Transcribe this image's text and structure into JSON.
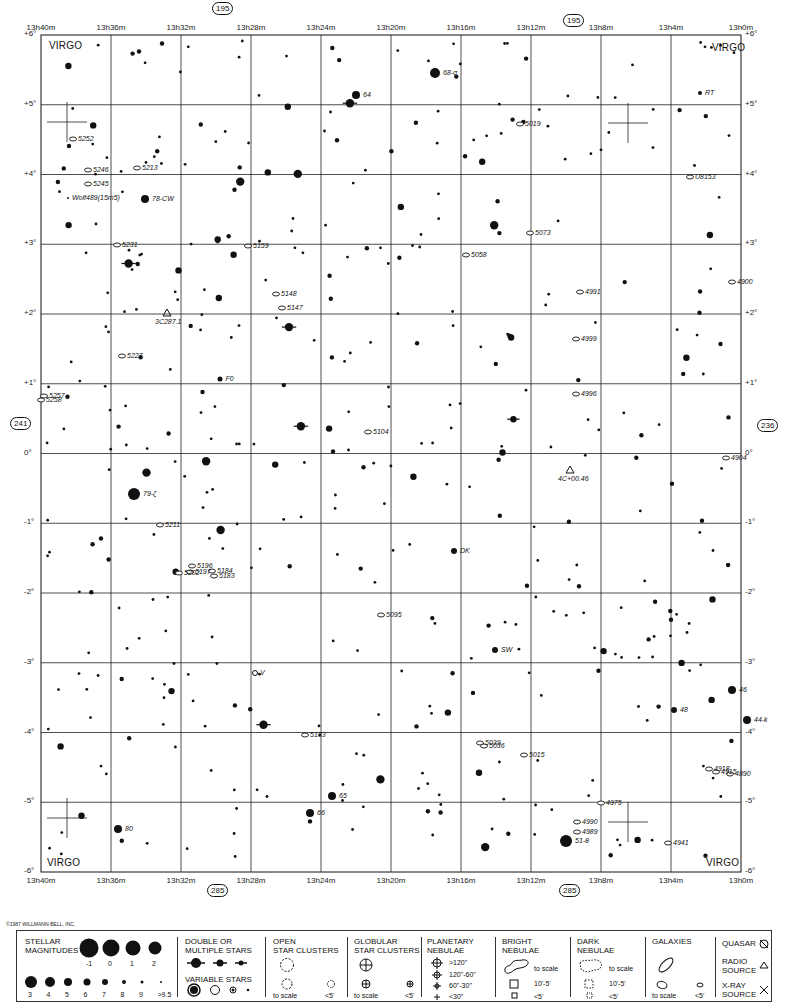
{
  "chart": {
    "constellation": "VIRGO",
    "ra_labels": [
      "13h40m",
      "13h36m",
      "13h32m",
      "13h28m",
      "13h24m",
      "13h20m",
      "13h16m",
      "13h12m",
      "13h8m",
      "13h4m",
      "13h0m"
    ],
    "dec_labels": [
      "+6°",
      "+5°",
      "+4°",
      "+3°",
      "+2°",
      "+1°",
      "0°",
      "-1°",
      "-2°",
      "-3°",
      "-4°",
      "-5°",
      "-6°"
    ],
    "page_refs": {
      "top_left": "195",
      "top_right": "195",
      "bottom_left": "285",
      "bottom_right": "285",
      "left": "241",
      "right": "236"
    },
    "corner_labels": [
      "VIRGO",
      "VIRGO",
      "VIRGO",
      "VIRGO"
    ],
    "copyright": "©1987 WILLMANN-BELL, INC."
  },
  "objects": {
    "galaxies": [
      {
        "id": "5252",
        "x": 73,
        "y": 139
      },
      {
        "id": "5246",
        "x": 88,
        "y": 170
      },
      {
        "id": "5245",
        "x": 88,
        "y": 184
      },
      {
        "id": "5213",
        "x": 137,
        "y": 168
      },
      {
        "id": "5231",
        "x": 117,
        "y": 245
      },
      {
        "id": "5159",
        "x": 248,
        "y": 246
      },
      {
        "id": "5148",
        "x": 276,
        "y": 294
      },
      {
        "id": "5147",
        "x": 282,
        "y": 308
      },
      {
        "id": "5227",
        "x": 122,
        "y": 356
      },
      {
        "id": "5257",
        "x": 44,
        "y": 396
      },
      {
        "id": "5258",
        "x": 41,
        "y": 400
      },
      {
        "id": "5104",
        "x": 368,
        "y": 432
      },
      {
        "id": "5211",
        "x": 160,
        "y": 525
      },
      {
        "id": "5196",
        "x": 192,
        "y": 566
      },
      {
        "id": "5202",
        "x": 179,
        "y": 573
      },
      {
        "id": "5197",
        "x": 190,
        "y": 572
      },
      {
        "id": "5184",
        "x": 212,
        "y": 571
      },
      {
        "id": "5183",
        "x": 214,
        "y": 576
      },
      {
        "id": "5095",
        "x": 381,
        "y": 615
      },
      {
        "id": "5133",
        "x": 305,
        "y": 735
      },
      {
        "id": "5039",
        "x": 480,
        "y": 743
      },
      {
        "id": "5036",
        "x": 484,
        "y": 746
      },
      {
        "id": "5015",
        "x": 524,
        "y": 755
      },
      {
        "id": "5019",
        "x": 520,
        "y": 124
      },
      {
        "id": "5073",
        "x": 530,
        "y": 233
      },
      {
        "id": "5058",
        "x": 466,
        "y": 255
      },
      {
        "id": "U8153",
        "x": 690,
        "y": 177
      },
      {
        "id": "4991",
        "x": 580,
        "y": 292
      },
      {
        "id": "4900",
        "x": 732,
        "y": 282
      },
      {
        "id": "4999",
        "x": 576,
        "y": 339
      },
      {
        "id": "4996",
        "x": 576,
        "y": 394
      },
      {
        "id": "4904",
        "x": 726,
        "y": 458
      },
      {
        "id": "4918",
        "x": 709,
        "y": 769
      },
      {
        "id": "4915",
        "x": 716,
        "y": 772
      },
      {
        "id": "4890",
        "x": 730,
        "y": 774
      },
      {
        "id": "4975",
        "x": 601,
        "y": 803
      },
      {
        "id": "4990",
        "x": 577,
        "y": 822
      },
      {
        "id": "4989",
        "x": 577,
        "y": 832
      },
      {
        "id": "4941",
        "x": 668,
        "y": 843
      }
    ],
    "named_stars": [
      {
        "id": "68-σ",
        "x": 435,
        "y": 73,
        "r": 5
      },
      {
        "id": "64",
        "x": 356,
        "y": 95,
        "r": 4
      },
      {
        "id": "RT",
        "x": 700,
        "y": 93,
        "r": 2
      },
      {
        "id": "78-CW",
        "x": 145,
        "y": 199,
        "r": 4
      },
      {
        "id": "Wolf489(15m5)",
        "x": 68,
        "y": 198,
        "r": 1
      },
      {
        "id": "F0",
        "x": 220,
        "y": 379,
        "r": 2.5
      },
      {
        "id": "79-ζ",
        "x": 134,
        "y": 494,
        "r": 6
      },
      {
        "id": "DK",
        "x": 454,
        "y": 551,
        "r": 3
      },
      {
        "id": "SW",
        "x": 495,
        "y": 650,
        "r": 3
      },
      {
        "id": "48",
        "x": 674,
        "y": 710,
        "r": 3
      },
      {
        "id": "46",
        "x": 732,
        "y": 690,
        "r": 4
      },
      {
        "id": "44-k",
        "x": 747,
        "y": 720,
        "r": 4
      },
      {
        "id": "65",
        "x": 332,
        "y": 796,
        "r": 4
      },
      {
        "id": "66",
        "x": 310,
        "y": 813,
        "r": 4
      },
      {
        "id": "80",
        "x": 118,
        "y": 829,
        "r": 4
      },
      {
        "id": "51-θ",
        "x": 566,
        "y": 841,
        "r": 6
      }
    ],
    "other": [
      {
        "id": "3C287.1",
        "type": "radio-source",
        "x": 167,
        "y": 313
      },
      {
        "id": "4C+00.46",
        "type": "radio-source",
        "x": 570,
        "y": 470
      },
      {
        "id": "V",
        "type": "variable",
        "x": 255,
        "y": 673
      }
    ]
  },
  "legend": {
    "stellar_magnitudes": {
      "title": "STELLAR\nMAGNITUDES",
      "row1": [
        "-1",
        "0",
        "1",
        "2"
      ],
      "row2": [
        "3",
        "4",
        "5",
        "6",
        "7",
        "8",
        "9",
        ">9.5"
      ]
    },
    "double_stars": {
      "title": "DOUBLE OR\nMULTIPLE STARS"
    },
    "variable_stars": {
      "title": "VARIABLE STARS"
    },
    "open_clusters": {
      "title": "OPEN\nSTAR CLUSTERS",
      "to_scale": "to scale",
      "small": "<5'"
    },
    "globular_clusters": {
      "title": "GLOBULAR\nSTAR CLUSTERS",
      "to_scale": "to scale",
      "small": "<5'"
    },
    "planetary_nebulae": {
      "title": "PLANETARY\nNEBULAE",
      "sizes": [
        ">120\"",
        "120\"-60\"",
        "60\"-30\"",
        "<30\""
      ]
    },
    "bright_nebulae": {
      "title": "BRIGHT\nNEBULAE",
      "to_scale": "to scale",
      "mid": "10'-5'",
      "small": "<5'"
    },
    "dark_nebulae": {
      "title": "DARK\nNEBULAE",
      "to_scale": "to scale",
      "mid": "10'-5'",
      "small": "<5'"
    },
    "galaxies": {
      "title": "GALAXIES",
      "to_scale": "to scale",
      "small": "<5'"
    },
    "quasar": {
      "title": "QUASAR"
    },
    "radio_source": {
      "title": "RADIO\nSOURCE"
    },
    "xray_source": {
      "title": "X-RAY\nSOURCE"
    }
  }
}
